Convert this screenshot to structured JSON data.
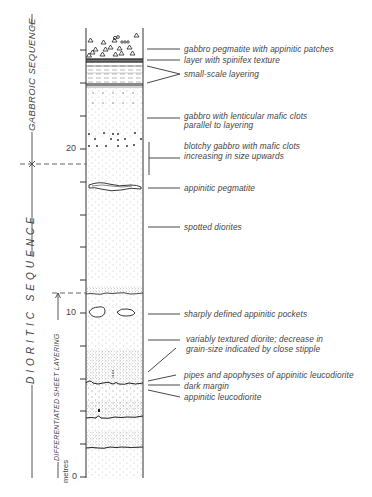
{
  "figure": {
    "unit_label": "metres",
    "scale_ticks": [
      {
        "value": "0",
        "y": 477
      },
      {
        "value": "10",
        "y": 313
      },
      {
        "value": "20",
        "y": 149
      }
    ],
    "sequences": [
      {
        "name": "GABBROIC SEQUENCE",
        "range_m": [
          19.5,
          26.5
        ]
      },
      {
        "name": "DIORITIC SEQUENCE",
        "range_m": [
          0,
          19.5
        ]
      },
      {
        "name": "DIFFERENTIATED SHEET LAYERING",
        "range_m": [
          0,
          11
        ]
      }
    ],
    "annotations": [
      {
        "text": "gabbro pegmatite with appinitic patches",
        "y": 48
      },
      {
        "text": "layer with spinifex texture",
        "y": 58
      },
      {
        "text": "small-scale layering",
        "y": 71
      },
      {
        "text": "gabbro with lenticular mafic clots",
        "y": 114
      },
      {
        "text": "parallel to layering",
        "y": 123
      },
      {
        "text": "blotchy gabbro with mafic clots",
        "y": 144
      },
      {
        "text": "increasing in size upwards",
        "y": 154
      },
      {
        "text": "appinitic pegmatite",
        "y": 184
      },
      {
        "text": "spotted diorites",
        "y": 227
      },
      {
        "text": "sharply defined appinitic pockets",
        "y": 314
      },
      {
        "text": "variably textured diorite; decrease in",
        "y": 340
      },
      {
        "text": "grain-size indicated by close stipple",
        "y": 350
      },
      {
        "text": "pipes and apophyses of appinitic leucodiorite",
        "y": 374
      },
      {
        "text": "dark margin",
        "y": 385
      },
      {
        "text": "appinitic leucodiorite",
        "y": 396
      }
    ]
  }
}
